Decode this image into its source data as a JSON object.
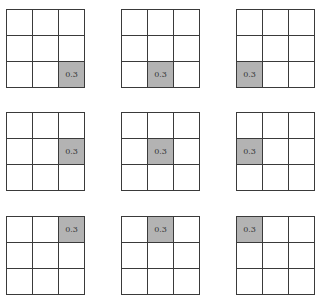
{
  "diagram": {
    "grid_size": 3,
    "highlight_color": "#b3b3b3",
    "grids": [
      {
        "row": 0,
        "col": 0,
        "active_cell": [
          2,
          2
        ],
        "value": "0.3"
      },
      {
        "row": 0,
        "col": 1,
        "active_cell": [
          2,
          1
        ],
        "value": "0.3"
      },
      {
        "row": 0,
        "col": 2,
        "active_cell": [
          2,
          0
        ],
        "value": "0.3"
      },
      {
        "row": 1,
        "col": 0,
        "active_cell": [
          1,
          2
        ],
        "value": "0.3"
      },
      {
        "row": 1,
        "col": 1,
        "active_cell": [
          1,
          1
        ],
        "value": "0.3"
      },
      {
        "row": 1,
        "col": 2,
        "active_cell": [
          1,
          0
        ],
        "value": "0.3"
      },
      {
        "row": 2,
        "col": 0,
        "active_cell": [
          0,
          2
        ],
        "value": "0.3"
      },
      {
        "row": 2,
        "col": 1,
        "active_cell": [
          0,
          1
        ],
        "value": "0.3"
      },
      {
        "row": 2,
        "col": 2,
        "active_cell": [
          0,
          0
        ],
        "value": "0.3"
      }
    ]
  }
}
